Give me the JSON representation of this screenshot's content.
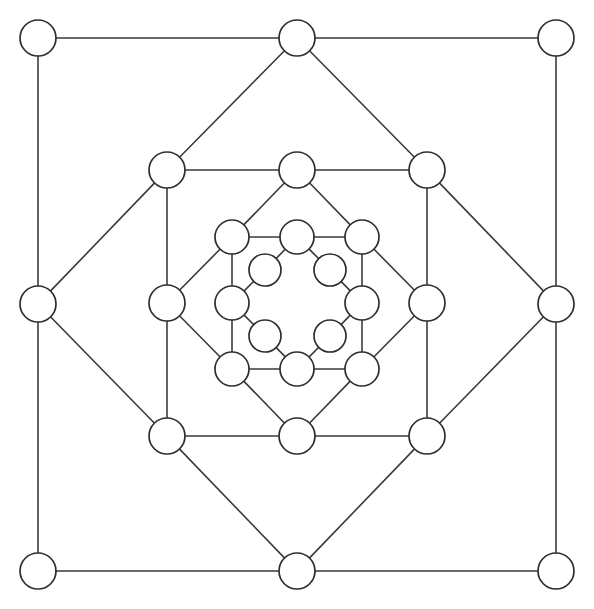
{
  "figure": {
    "background_color": "#ffffff",
    "width": 594,
    "height": 609,
    "node_fill": "#ffffff",
    "node_stroke": "#2e2e2e",
    "edge_color": "#3a3a3a",
    "edge_width": 1.6,
    "node_stroke_width": 1.7,
    "node_count": 28,
    "edge_count": 48,
    "ring_count": 4
  },
  "chart_data": {
    "type": "graph",
    "layout": "concentric",
    "directed": false,
    "weighted": false,
    "node_count": 28,
    "edge_count": 48,
    "rings": [
      {
        "name": "ring-1-outer",
        "node_count": 8,
        "radius_px": 259,
        "node_radius_px": 18
      },
      {
        "name": "ring-2",
        "node_count": 8,
        "radius_px": 130,
        "node_radius_px": 18
      },
      {
        "name": "ring-3",
        "node_count": 8,
        "radius_px": 65,
        "node_radius_px": 17
      },
      {
        "name": "ring-4-inner",
        "node_count": 4,
        "radius_px": 46,
        "node_radius_px": 16
      }
    ],
    "nodes": [
      {
        "id": "o-nw",
        "ring": 1,
        "x": 38,
        "y": 38,
        "r": 18,
        "degree": 2
      },
      {
        "id": "o-n",
        "ring": 1,
        "x": 297,
        "y": 38,
        "r": 18,
        "degree": 4
      },
      {
        "id": "o-ne",
        "ring": 1,
        "x": 556,
        "y": 38,
        "r": 18,
        "degree": 2
      },
      {
        "id": "o-e",
        "ring": 1,
        "x": 556,
        "y": 304,
        "r": 18,
        "degree": 4
      },
      {
        "id": "o-se",
        "ring": 1,
        "x": 556,
        "y": 571,
        "r": 18,
        "degree": 2
      },
      {
        "id": "o-s",
        "ring": 1,
        "x": 297,
        "y": 571,
        "r": 18,
        "degree": 4
      },
      {
        "id": "o-sw",
        "ring": 1,
        "x": 38,
        "y": 571,
        "r": 18,
        "degree": 2
      },
      {
        "id": "o-w",
        "ring": 1,
        "x": 38,
        "y": 304,
        "r": 18,
        "degree": 4
      },
      {
        "id": "m-nw",
        "ring": 2,
        "x": 167,
        "y": 170,
        "r": 18,
        "degree": 4
      },
      {
        "id": "m-n",
        "ring": 2,
        "x": 297,
        "y": 170,
        "r": 18,
        "degree": 4
      },
      {
        "id": "m-ne",
        "ring": 2,
        "x": 427,
        "y": 170,
        "r": 18,
        "degree": 4
      },
      {
        "id": "m-e",
        "ring": 2,
        "x": 427,
        "y": 303,
        "r": 18,
        "degree": 4
      },
      {
        "id": "m-se",
        "ring": 2,
        "x": 427,
        "y": 436,
        "r": 18,
        "degree": 4
      },
      {
        "id": "m-s",
        "ring": 2,
        "x": 297,
        "y": 436,
        "r": 18,
        "degree": 4
      },
      {
        "id": "m-sw",
        "ring": 2,
        "x": 167,
        "y": 436,
        "r": 18,
        "degree": 4
      },
      {
        "id": "m-w",
        "ring": 2,
        "x": 167,
        "y": 303,
        "r": 18,
        "degree": 4
      },
      {
        "id": "i-nw",
        "ring": 3,
        "x": 232,
        "y": 237,
        "r": 17,
        "degree": 4
      },
      {
        "id": "i-n",
        "ring": 3,
        "x": 297,
        "y": 237,
        "r": 17,
        "degree": 4
      },
      {
        "id": "i-ne",
        "ring": 3,
        "x": 362,
        "y": 237,
        "r": 17,
        "degree": 4
      },
      {
        "id": "i-e",
        "ring": 3,
        "x": 362,
        "y": 303,
        "r": 17,
        "degree": 4
      },
      {
        "id": "i-se",
        "ring": 3,
        "x": 362,
        "y": 369,
        "r": 17,
        "degree": 4
      },
      {
        "id": "i-s",
        "ring": 3,
        "x": 297,
        "y": 369,
        "r": 17,
        "degree": 4
      },
      {
        "id": "i-sw",
        "ring": 3,
        "x": 232,
        "y": 369,
        "r": 17,
        "degree": 4
      },
      {
        "id": "i-w",
        "ring": 3,
        "x": 232,
        "y": 303,
        "r": 17,
        "degree": 4
      },
      {
        "id": "c-nw",
        "ring": 4,
        "x": 265,
        "y": 270,
        "r": 16,
        "degree": 2
      },
      {
        "id": "c-ne",
        "ring": 4,
        "x": 330,
        "y": 270,
        "r": 16,
        "degree": 2
      },
      {
        "id": "c-se",
        "ring": 4,
        "x": 330,
        "y": 336,
        "r": 16,
        "degree": 2
      },
      {
        "id": "c-sw",
        "ring": 4,
        "x": 265,
        "y": 336,
        "r": 16,
        "degree": 2
      }
    ],
    "edges": [
      [
        "o-nw",
        "o-n"
      ],
      [
        "o-n",
        "o-ne"
      ],
      [
        "o-ne",
        "o-e"
      ],
      [
        "o-e",
        "o-se"
      ],
      [
        "o-se",
        "o-s"
      ],
      [
        "o-s",
        "o-sw"
      ],
      [
        "o-sw",
        "o-w"
      ],
      [
        "o-w",
        "o-nw"
      ],
      [
        "o-n",
        "m-nw"
      ],
      [
        "o-n",
        "m-ne"
      ],
      [
        "o-e",
        "m-ne"
      ],
      [
        "o-e",
        "m-se"
      ],
      [
        "o-s",
        "m-se"
      ],
      [
        "o-s",
        "m-sw"
      ],
      [
        "o-w",
        "m-sw"
      ],
      [
        "o-w",
        "m-nw"
      ],
      [
        "m-nw",
        "m-n"
      ],
      [
        "m-n",
        "m-ne"
      ],
      [
        "m-ne",
        "m-e"
      ],
      [
        "m-e",
        "m-se"
      ],
      [
        "m-se",
        "m-s"
      ],
      [
        "m-s",
        "m-sw"
      ],
      [
        "m-sw",
        "m-w"
      ],
      [
        "m-w",
        "m-nw"
      ],
      [
        "m-n",
        "i-nw"
      ],
      [
        "m-n",
        "i-ne"
      ],
      [
        "m-e",
        "i-ne"
      ],
      [
        "m-e",
        "i-se"
      ],
      [
        "m-s",
        "i-se"
      ],
      [
        "m-s",
        "i-sw"
      ],
      [
        "m-w",
        "i-sw"
      ],
      [
        "m-w",
        "i-nw"
      ],
      [
        "i-nw",
        "i-n"
      ],
      [
        "i-n",
        "i-ne"
      ],
      [
        "i-ne",
        "i-e"
      ],
      [
        "i-e",
        "i-se"
      ],
      [
        "i-se",
        "i-s"
      ],
      [
        "i-s",
        "i-sw"
      ],
      [
        "i-sw",
        "i-w"
      ],
      [
        "i-w",
        "i-nw"
      ],
      [
        "i-n",
        "c-nw"
      ],
      [
        "i-n",
        "c-ne"
      ],
      [
        "i-e",
        "c-ne"
      ],
      [
        "i-e",
        "c-se"
      ],
      [
        "i-s",
        "c-se"
      ],
      [
        "i-s",
        "c-sw"
      ],
      [
        "i-w",
        "c-sw"
      ],
      [
        "i-w",
        "c-nw"
      ]
    ]
  }
}
